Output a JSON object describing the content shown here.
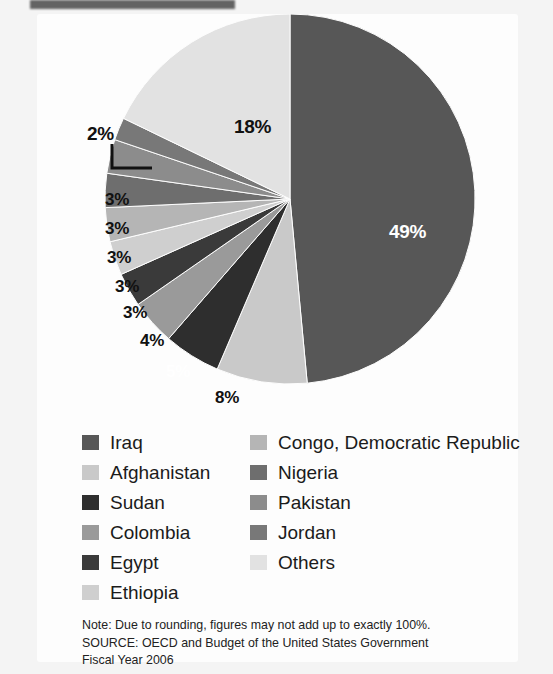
{
  "figure": {
    "background_color": "#fdfdfd",
    "page_color": "#f4f4f4"
  },
  "chart_data": {
    "type": "pie",
    "title": "",
    "subtitle": "",
    "xlabel": "",
    "ylabel": "",
    "legend_position": "bottom",
    "grid": false,
    "start_angle_deg": 0,
    "direction": "clockwise",
    "categories": [
      "Iraq",
      "Afghanistan",
      "Sudan",
      "Colombia",
      "Egypt",
      "Ethiopia",
      "Congo, Democratic Republic",
      "Nigeria",
      "Pakistan",
      "Jordan",
      "Others"
    ],
    "values": [
      49,
      8,
      5,
      4,
      3,
      3,
      3,
      3,
      3,
      2,
      18
    ],
    "value_labels": [
      "49%",
      "8%",
      "5%",
      "4%",
      "3%",
      "3%",
      "3%",
      "3%",
      "3%",
      "2%",
      "18%"
    ],
    "colors": [
      "#575757",
      "#c9c9c9",
      "#2e2e2e",
      "#9a9a9a",
      "#3a3a3a",
      "#cfcfcf",
      "#b5b5b5",
      "#6e6e6e",
      "#8c8c8c",
      "#787878",
      "#e2e2e2"
    ],
    "label_text_colors": [
      "#ffffff",
      "#111111",
      "#ffffff",
      "#111111",
      "#111111",
      "#111111",
      "#111111",
      "#111111",
      "#111111",
      "#111111",
      "#111111"
    ],
    "callout_slices": [
      "Jordan"
    ]
  },
  "slice_labels": [
    {
      "name": "label-49",
      "text": "49%",
      "x": 352,
      "y": 207,
      "tone": "light",
      "size": "lg"
    },
    {
      "name": "label-18",
      "text": "18%",
      "x": 197,
      "y": 102,
      "tone": "dark",
      "size": "lg"
    },
    {
      "name": "label-2",
      "text": "2%",
      "x": 50,
      "y": 109,
      "tone": "dark",
      "size": "lg"
    },
    {
      "name": "label-3-jordan-adjacent",
      "text": "3%",
      "x": 68,
      "y": 176,
      "tone": "dark",
      "size": "sm"
    },
    {
      "name": "label-3-b",
      "text": "3%",
      "x": 68,
      "y": 205,
      "tone": "dark",
      "size": "sm"
    },
    {
      "name": "label-3-c",
      "text": "3%",
      "x": 70,
      "y": 234,
      "tone": "dark",
      "size": "sm"
    },
    {
      "name": "label-3-d",
      "text": "3%",
      "x": 78,
      "y": 263,
      "tone": "dark",
      "size": "sm"
    },
    {
      "name": "label-3-e",
      "text": "3%",
      "x": 86,
      "y": 289,
      "tone": "dark",
      "size": "sm"
    },
    {
      "name": "label-4",
      "text": "4%",
      "x": 103,
      "y": 317,
      "tone": "dark",
      "size": "sm"
    },
    {
      "name": "label-5",
      "text": "5%",
      "x": 129,
      "y": 348,
      "tone": "light",
      "size": "sm"
    },
    {
      "name": "label-8",
      "text": "8%",
      "x": 178,
      "y": 374,
      "tone": "dark",
      "size": "sm"
    }
  ],
  "legend": {
    "left_column": [
      {
        "label": "Iraq",
        "color": "#575757"
      },
      {
        "label": "Afghanistan",
        "color": "#c9c9c9"
      },
      {
        "label": "Sudan",
        "color": "#2e2e2e"
      },
      {
        "label": "Colombia",
        "color": "#9a9a9a"
      },
      {
        "label": "Egypt",
        "color": "#3a3a3a"
      },
      {
        "label": "Ethiopia",
        "color": "#cfcfcf"
      }
    ],
    "right_column": [
      {
        "label": "Congo, Democratic Republic",
        "color": "#b5b5b5"
      },
      {
        "label": "Nigeria",
        "color": "#6e6e6e"
      },
      {
        "label": "Pakistan",
        "color": "#8c8c8c"
      },
      {
        "label": "Jordan",
        "color": "#787878"
      },
      {
        "label": "Others",
        "color": "#e2e2e2"
      }
    ]
  },
  "footnote": {
    "line1": "Note: Due to rounding, figures may not add up to exactly 100%.",
    "line2": "SOURCE: OECD and Budget of the United States Government",
    "line3": "Fiscal Year 2006"
  }
}
